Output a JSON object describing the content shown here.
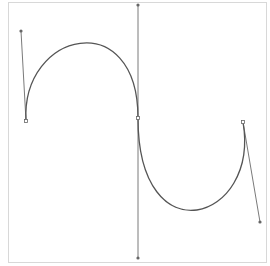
{
  "canvas": {
    "width": 270,
    "height": 266,
    "background": "#ffffff",
    "frame": {
      "x": 8,
      "y": 2,
      "width": 258,
      "height": 260,
      "color": "#d8d8d8"
    }
  },
  "colors": {
    "curve": "#555555",
    "handle_line": "#7a7a7a",
    "point_fill": "#ffffff",
    "point_stroke": "#666666"
  },
  "bezier": {
    "segments": [
      {
        "start": [
          26,
          121
        ],
        "control1": [
          21,
          31
        ],
        "control2": [
          138,
          5
        ],
        "end": [
          138,
          118
        ]
      },
      {
        "start": [
          138,
          118
        ],
        "control1": [
          138,
          258
        ],
        "control2": [
          260,
          222
        ],
        "end": [
          243,
          122
        ]
      }
    ],
    "anchors": [
      {
        "name": "anchor-start",
        "point": [
          26,
          121
        ]
      },
      {
        "name": "anchor-middle",
        "point": [
          138,
          118
        ]
      },
      {
        "name": "anchor-end",
        "point": [
          243,
          122
        ]
      }
    ],
    "handles": [
      {
        "name": "handle-start",
        "from": [
          26,
          121
        ],
        "to": [
          21,
          31
        ]
      },
      {
        "name": "handle-middle-in",
        "from": [
          138,
          118
        ],
        "to": [
          138,
          5
        ]
      },
      {
        "name": "handle-middle-out",
        "from": [
          138,
          118
        ],
        "to": [
          138,
          258
        ]
      },
      {
        "name": "handle-end",
        "from": [
          243,
          122
        ],
        "to": [
          260,
          222
        ]
      }
    ]
  }
}
